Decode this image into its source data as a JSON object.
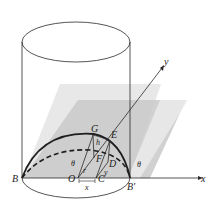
{
  "labels": {
    "B": "B",
    "B_prime": "B'",
    "O": "O",
    "C": "C",
    "G": "G",
    "E": "E",
    "F": "F",
    "D": "D",
    "h": "h",
    "r": "r",
    "y_seg": "y",
    "x_seg": "x",
    "theta_left": "θ",
    "theta_right": "θ",
    "x_axis": "x",
    "y_axis": "y"
  },
  "colors": {
    "stroke": "#2a2a2a",
    "plane_light": "#e6e6e6",
    "plane_dark": "#b9b9b9",
    "base_shade": "#cfcfcf"
  }
}
